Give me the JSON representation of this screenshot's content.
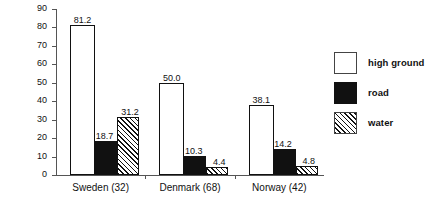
{
  "chart_data": {
    "type": "bar",
    "title": "",
    "subtitle": "",
    "xlabel": "",
    "ylabel": "categories (in percent)",
    "ylim": [
      0,
      90
    ],
    "ytick_labels": [
      "0",
      "10",
      "20",
      "30",
      "40",
      "50",
      "60",
      "70",
      "80",
      "90"
    ],
    "ytick_values": [
      0,
      10,
      20,
      30,
      40,
      50,
      60,
      70,
      80,
      90
    ],
    "grid": false,
    "legend_position": "right",
    "categories": [
      "Sweden (32)",
      "Denmark (68)",
      "Norway (42)"
    ],
    "series": [
      {
        "name": "high ground",
        "fill": "white",
        "values": [
          81.2,
          50.0,
          38.1
        ],
        "labels": [
          "81.2",
          "50.0",
          "38.1"
        ]
      },
      {
        "name": "road",
        "fill": "black",
        "values": [
          18.7,
          10.3,
          14.2
        ],
        "labels": [
          "18.7",
          "10.3",
          "14.2"
        ]
      },
      {
        "name": "water",
        "fill": "diagonal-hatch",
        "values": [
          31.2,
          4.4,
          4.8
        ],
        "labels": [
          "31.2",
          "4.4",
          "4.8"
        ]
      }
    ],
    "legend": [
      {
        "label": "high ground",
        "swatch": "white-square"
      },
      {
        "label": "road",
        "swatch": "black-square"
      },
      {
        "label": "water",
        "swatch": "hatched-square"
      }
    ]
  },
  "colors": {
    "axis": "#555555",
    "text": "#111111",
    "bar_outline": "#111111",
    "bar_fill_road": "#111111",
    "background": "#ffffff"
  }
}
